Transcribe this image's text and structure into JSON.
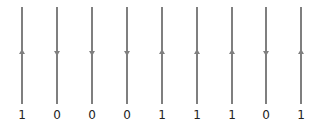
{
  "diagram": {
    "line_color": "#7f7f7f",
    "wires": [
      {
        "x": 22,
        "direction": "up",
        "bit": "1"
      },
      {
        "x": 57,
        "direction": "down",
        "bit": "0"
      },
      {
        "x": 92,
        "direction": "down",
        "bit": "0"
      },
      {
        "x": 127,
        "direction": "down",
        "bit": "0"
      },
      {
        "x": 162,
        "direction": "up",
        "bit": "1"
      },
      {
        "x": 197,
        "direction": "up",
        "bit": "1"
      },
      {
        "x": 232,
        "direction": "up",
        "bit": "1"
      },
      {
        "x": 266,
        "direction": "down",
        "bit": "0"
      },
      {
        "x": 301,
        "direction": "up",
        "bit": "1"
      }
    ]
  }
}
